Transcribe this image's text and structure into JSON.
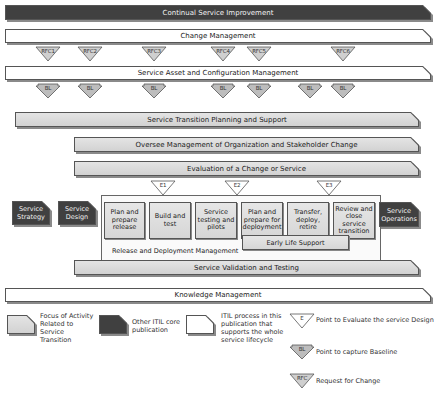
{
  "diagram": {
    "top_bars": {
      "csi": "Continual Service Improvement",
      "change_mgmt": "Change Management",
      "sacm": "Service Asset and Configuration Management"
    },
    "rfc_markers": [
      "RFC1",
      "RFC2",
      "RFC3",
      "RFC4",
      "RFC5",
      "RFC6"
    ],
    "bl_markers": [
      "BL",
      "BL",
      "BL",
      "BL",
      "BL",
      "BL",
      "BL"
    ],
    "focus_bars": {
      "stps": "Service Transition Planning and Support",
      "oversee": "Oversee Management of Organization and Stakeholder Change",
      "evaluation": "Evaluation of a Change or Service",
      "svt": "Service Validation and Testing"
    },
    "e_markers": [
      "E1",
      "E2",
      "E3"
    ],
    "side_boxes": {
      "strategy": "Service Strategy",
      "design": "Service Design",
      "operations": "Service Operations"
    },
    "release_steps": [
      "Plan and prepare release",
      "Build and test",
      "Service testing and pilots",
      "Plan and prepare for deployment",
      "Transfer, deploy, retire",
      "Review and close service transition"
    ],
    "early_life_support": "Early Life Support",
    "release_deployment_label": "Release and Deployment Management",
    "knowledge_mgmt": "Knowledge Management"
  },
  "legend": {
    "focus": "Focus of Activity Related to Service Transition",
    "other_core": "Other ITIL core publication",
    "itil_process": "ITIL process in this publication that supports the whole service lifecycle",
    "e_marker_label": "E",
    "e_text": "Point to Evaluate the service Design",
    "bl_marker_label": "BL",
    "bl_text": "Point to capture Baseline",
    "rfc_marker_label": "RFC",
    "rfc_text": "Request for Change"
  },
  "colors": {
    "dark": "#404040",
    "grey": "#d9d9d9",
    "white": "#ffffff",
    "outline": "#555555"
  }
}
